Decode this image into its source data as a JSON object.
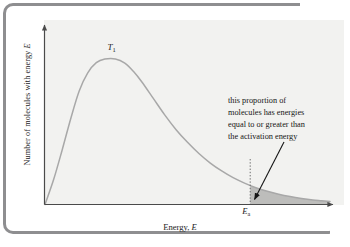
{
  "figure": {
    "kind": "maxwell-boltzmann-distribution-diagram",
    "background": "#ffffff",
    "panel_color": "#f2f2f0",
    "frame_color": "#8e8e90"
  },
  "axes": {
    "y_title_prefix": "Number of molecules with energy ",
    "y_title_symbol": "E",
    "x_title_prefix": "Energy, ",
    "x_title_symbol": "E",
    "axis_color": "#5a5a5a"
  },
  "labels": {
    "peak_symbol": "T",
    "peak_subscript": "1",
    "ea_symbol": "E",
    "ea_subscript": "a"
  },
  "annotation": {
    "line1": "this proportion of",
    "line2": "molecules has energies",
    "line3": "equal to or greater than",
    "line4": "the activation energy"
  },
  "chart_data": {
    "type": "area",
    "title": "",
    "xlabel": "Energy, E",
    "ylabel": "Number of molecules with energy E",
    "grid": false,
    "legend": null,
    "curve_label": "T1",
    "curve_color": "#a8a8a8",
    "shade_color": "#b9b9b7",
    "xlim": [
      0,
      1
    ],
    "ylim": [
      0,
      1
    ],
    "activation_energy_x": 0.72,
    "peak_x": 0.247,
    "peak_y": 0.885,
    "annotation_target_x": 0.735,
    "annotation_target_y": 0.03,
    "x": [
      0.0,
      0.03,
      0.06,
      0.09,
      0.12,
      0.15,
      0.18,
      0.21,
      0.247,
      0.28,
      0.31,
      0.34,
      0.38,
      0.42,
      0.46,
      0.5,
      0.54,
      0.58,
      0.62,
      0.66,
      0.7,
      0.74,
      0.78,
      0.82,
      0.86,
      0.9,
      0.94,
      0.97,
      1.0
    ],
    "y": [
      0.0,
      0.15,
      0.33,
      0.52,
      0.69,
      0.8,
      0.862,
      0.884,
      0.885,
      0.86,
      0.81,
      0.745,
      0.645,
      0.545,
      0.455,
      0.378,
      0.31,
      0.252,
      0.204,
      0.163,
      0.13,
      0.102,
      0.08,
      0.062,
      0.048,
      0.037,
      0.028,
      0.023,
      0.018
    ]
  }
}
